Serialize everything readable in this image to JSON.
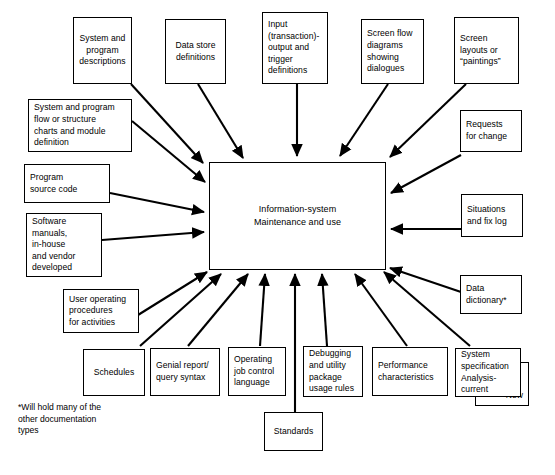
{
  "diagram": {
    "center": {
      "label": "Information-system\nMaintenance and use"
    },
    "footnote": "*Will hold many of the\n  other documentation\n  types",
    "colors": {
      "line": "#000000",
      "background": "#ffffff",
      "text": "#000000"
    },
    "nodes": [
      {
        "id": "system-program-descriptions",
        "label": "System and\nprogram\ndescriptions"
      },
      {
        "id": "data-store-definitions",
        "label": "Data store\ndefinitions"
      },
      {
        "id": "input-output-trigger-definitions",
        "label": "Input\n(transaction)-\noutput and\ntrigger\ndefinitions"
      },
      {
        "id": "screen-flow-diagrams",
        "label": "Screen flow\ndiagrams\nshowing\ndialogues"
      },
      {
        "id": "screen-layouts-paintings",
        "label": "Screen\nlayouts or\n“paintings”"
      },
      {
        "id": "system-program-flow-charts",
        "label": "System and program\nflow or structure\ncharts and module\ndefinition"
      },
      {
        "id": "requests-for-change",
        "label": "Requests\nfor change"
      },
      {
        "id": "program-source-code",
        "label": "Program\nsource code"
      },
      {
        "id": "situations-and-fix-log",
        "label": "Situations\nand fix log"
      },
      {
        "id": "software-manuals",
        "label": "Software\nmanuals,\nin-house\nand vendor\ndeveloped"
      },
      {
        "id": "user-operating-procedures",
        "label": "User operating\nprocedures\nfor activities"
      },
      {
        "id": "data-dictionary",
        "label": "Data\ndictionary*"
      },
      {
        "id": "schedules",
        "label": "Schedules"
      },
      {
        "id": "genial-report-query-syntax",
        "label": "Genial report/\nquery syntax"
      },
      {
        "id": "operating-job-control-language",
        "label": "Operating\njob control\nlanguage"
      },
      {
        "id": "debugging-utility-package",
        "label": "Debugging\nand utility\npackage\nusage rules"
      },
      {
        "id": "performance-characteristics",
        "label": "Performance\ncharacteristics"
      },
      {
        "id": "system-specification",
        "label": "System\nspecification\nAnalysis-\ncurrent"
      },
      {
        "id": "system-specification-new",
        "label": "New"
      },
      {
        "id": "standards",
        "label": "Standards"
      }
    ]
  }
}
